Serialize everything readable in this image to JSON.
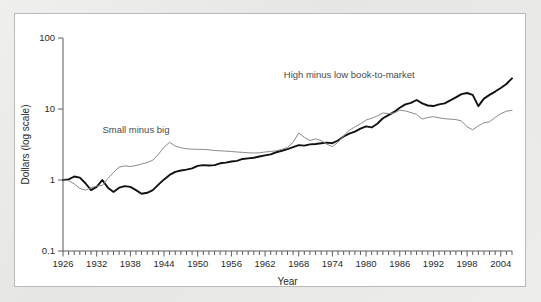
{
  "figure": {
    "panel_background": "#ffffff",
    "outer_background": "#e9e9e7",
    "border_color": "#b9b9b9"
  },
  "chart_data": {
    "type": "line",
    "title": "",
    "subtitle": "",
    "xlabel": "Year",
    "ylabel": "Dollars (log scale)",
    "yscale": "log",
    "ylim": [
      0.1,
      100
    ],
    "xlim": [
      1926,
      2006
    ],
    "grid": false,
    "legend_position": "inline-annotation",
    "y_ticks": [
      0.1,
      1,
      10,
      100
    ],
    "y_tick_labels": [
      "0.1",
      "1",
      "10",
      "100"
    ],
    "x_ticks": [
      1926,
      1932,
      1938,
      1944,
      1950,
      1956,
      1962,
      1968,
      1974,
      1980,
      1986,
      1992,
      1998,
      2004
    ],
    "x_tick_labels": [
      "1926",
      "1932",
      "1938",
      "1944",
      "1950",
      "1956",
      "1962",
      "1968",
      "1974",
      "1980",
      "1986",
      "1992",
      "1998",
      "2004"
    ],
    "x_minor_tick_step": 1,
    "annotations": [
      {
        "text": "Small minus big",
        "x": 1939,
        "y": 4.6,
        "color": "#4a4a4a"
      },
      {
        "text": "High minus low book-to-market",
        "x": 1977,
        "y": 27.0,
        "color": "#4a4a4a"
      }
    ],
    "x": [
      1926,
      1927,
      1928,
      1929,
      1930,
      1931,
      1932,
      1933,
      1934,
      1935,
      1936,
      1937,
      1938,
      1939,
      1940,
      1941,
      1942,
      1943,
      1944,
      1945,
      1946,
      1947,
      1948,
      1949,
      1950,
      1951,
      1952,
      1953,
      1954,
      1955,
      1956,
      1957,
      1958,
      1959,
      1960,
      1961,
      1962,
      1963,
      1964,
      1965,
      1966,
      1967,
      1968,
      1969,
      1970,
      1971,
      1972,
      1973,
      1974,
      1975,
      1976,
      1977,
      1978,
      1979,
      1980,
      1981,
      1982,
      1983,
      1984,
      1985,
      1986,
      1987,
      1988,
      1989,
      1990,
      1991,
      1992,
      1993,
      1994,
      1995,
      1996,
      1997,
      1998,
      1999,
      2000,
      2001,
      2002,
      2003,
      2004,
      2005,
      2006
    ],
    "series": [
      {
        "name": "High minus low book-to-market",
        "style": "thick-black",
        "color": "#111111",
        "values": [
          1.0,
          1.02,
          1.12,
          1.08,
          0.9,
          0.72,
          0.8,
          1.0,
          0.78,
          0.68,
          0.78,
          0.82,
          0.8,
          0.72,
          0.64,
          0.66,
          0.72,
          0.86,
          1.02,
          1.18,
          1.3,
          1.36,
          1.4,
          1.46,
          1.58,
          1.62,
          1.6,
          1.62,
          1.72,
          1.76,
          1.82,
          1.86,
          1.98,
          2.02,
          2.06,
          2.14,
          2.22,
          2.3,
          2.46,
          2.58,
          2.72,
          2.9,
          3.1,
          3.05,
          3.18,
          3.22,
          3.3,
          3.36,
          3.3,
          3.6,
          4.1,
          4.5,
          4.8,
          5.3,
          5.7,
          5.5,
          6.2,
          7.4,
          8.2,
          9.1,
          10.4,
          11.6,
          12.2,
          13.4,
          12.0,
          11.2,
          11.0,
          11.6,
          12.0,
          13.2,
          14.6,
          16.2,
          16.8,
          15.8,
          11.0,
          14.0,
          15.8,
          17.6,
          19.8,
          22.5,
          27.0
        ]
      },
      {
        "name": "Small minus big",
        "style": "thin-gray",
        "color": "#8a8a8a",
        "values": [
          1.0,
          0.98,
          0.88,
          0.76,
          0.72,
          0.78,
          0.82,
          0.84,
          1.05,
          1.28,
          1.52,
          1.58,
          1.55,
          1.6,
          1.68,
          1.76,
          1.9,
          2.3,
          2.9,
          3.4,
          3.0,
          2.85,
          2.75,
          2.72,
          2.7,
          2.7,
          2.66,
          2.6,
          2.58,
          2.55,
          2.52,
          2.48,
          2.45,
          2.42,
          2.4,
          2.42,
          2.48,
          2.52,
          2.58,
          2.7,
          2.88,
          3.4,
          4.6,
          4.0,
          3.6,
          3.8,
          3.6,
          3.2,
          2.95,
          3.4,
          4.2,
          5.0,
          5.6,
          6.2,
          7.0,
          7.4,
          8.0,
          8.8,
          8.6,
          8.8,
          9.6,
          9.4,
          8.9,
          8.4,
          7.2,
          7.6,
          7.8,
          7.5,
          7.3,
          7.2,
          7.1,
          6.8,
          5.6,
          5.1,
          5.8,
          6.4,
          6.6,
          7.6,
          8.6,
          9.3,
          9.6
        ]
      }
    ]
  }
}
